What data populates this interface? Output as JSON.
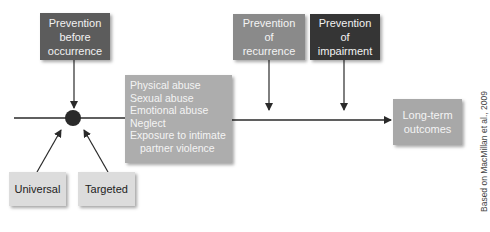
{
  "diagram": {
    "boxes": {
      "prevention_before": {
        "lines": [
          "Prevention",
          "before",
          "occurrence"
        ],
        "color": "#5c5c5c"
      },
      "prevention_recurrence": {
        "lines": [
          "Prevention",
          "of",
          "recurrence"
        ],
        "color": "#8a8a8a"
      },
      "prevention_impairment": {
        "lines": [
          "Prevention",
          "of",
          "impairment"
        ],
        "color": "#353535"
      },
      "harm_types": {
        "lines": [
          "Physical abuse",
          "Sexual abuse",
          "Emotional abuse",
          "Neglect",
          "Exposure to intimate",
          "partner violence"
        ],
        "color": "#adadad"
      },
      "long_term": {
        "lines": [
          "Long-term",
          "outcomes"
        ],
        "color": "#a8a8a8"
      },
      "universal": {
        "label": "Universal",
        "color": "#dcdcdc"
      },
      "targeted": {
        "label": "Targeted",
        "color": "#dcdcdc"
      }
    },
    "credit": "Based on MacMillan et al., 2009"
  }
}
